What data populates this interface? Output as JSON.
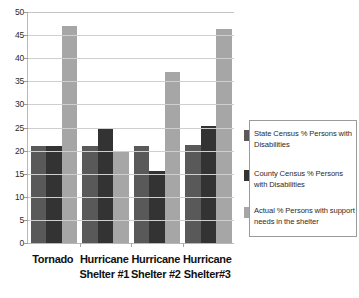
{
  "chart_data": {
    "type": "bar",
    "title": "",
    "xlabel": "",
    "ylabel": "",
    "ylim": [
      0,
      50
    ],
    "ytick_step": 5,
    "yticks": [
      50,
      45,
      40,
      35,
      30,
      25,
      20,
      15,
      10,
      5,
      0
    ],
    "grid": "horizontal",
    "legend_position": "right",
    "categories": [
      {
        "line1": "Tornado",
        "line2": ""
      },
      {
        "line1": "Hurricane",
        "line2": "Shelter #1"
      },
      {
        "line1": "Hurricane",
        "line2": "Shelter #2"
      },
      {
        "line1": "Hurricane",
        "line2": "Shelter#3"
      }
    ],
    "series": [
      {
        "name": "State Census % Persons with Disabilities",
        "color": "#595959",
        "values": [
          21.0,
          21.0,
          21.1,
          21.3
        ]
      },
      {
        "name": "County Census % Persons with Disabilities",
        "color": "#333333",
        "values": [
          21.0,
          24.8,
          15.5,
          25.3
        ]
      },
      {
        "name": "Actual % Persons with support needs in the shelter",
        "color": "#a6a6a6",
        "values": [
          47.0,
          20.0,
          37.1,
          46.3
        ]
      }
    ]
  },
  "legend": {
    "entries": [
      {
        "label": "State Census % Persons with Disabilities",
        "color": "#595959"
      },
      {
        "label": "County Census % Persons with Disabilities",
        "color": "#333333"
      },
      {
        "label": "Actual % Persons with support needs in the shelter",
        "color": "#a6a6a6"
      }
    ]
  },
  "colors": {
    "series_state": "#595959",
    "series_county": "#333333",
    "series_actual": "#a6a6a6",
    "gridline": "#cfcfcf",
    "axis": "#b8b8b8",
    "background": "#ffffff"
  }
}
